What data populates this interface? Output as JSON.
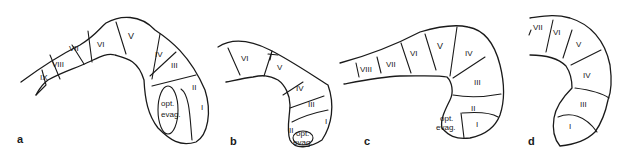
{
  "figure": {
    "panels": [
      {
        "id": "a",
        "letter": "a",
        "segments": [
          "IX",
          "VIII",
          "VII",
          "VI",
          "V",
          "IV",
          "III",
          "II",
          "I"
        ],
        "region_label_line1": "opt.",
        "region_label_line2": "evag."
      },
      {
        "id": "b",
        "letter": "b",
        "segments": [
          "VI",
          "V",
          "IV",
          "III",
          "II",
          "I"
        ],
        "region_label_line1": "opt.",
        "region_label_line2": "evag."
      },
      {
        "id": "c",
        "letter": "c",
        "segments": [
          "VIII",
          "VII",
          "VI",
          "V",
          "IV",
          "III",
          "II",
          "I"
        ],
        "region_label_line1": "opt.",
        "region_label_line2": "evag."
      },
      {
        "id": "d",
        "letter": "d",
        "segments": [
          "VII",
          "VI",
          "V",
          "IV",
          "III",
          "I"
        ]
      }
    ]
  }
}
